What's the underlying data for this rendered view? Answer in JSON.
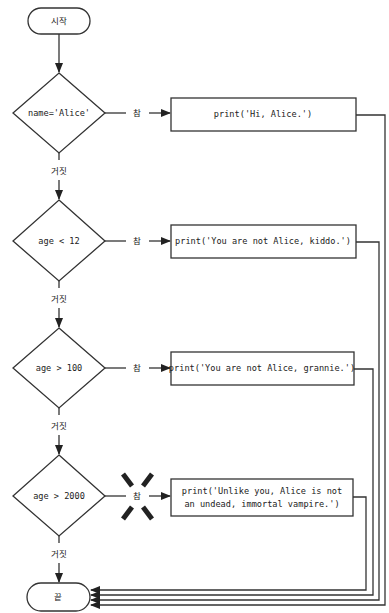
{
  "flowchart": {
    "start": {
      "label": "시작"
    },
    "end": {
      "label": "끝"
    },
    "decisions": [
      {
        "condition": "name='Alice'",
        "true_label": "참",
        "false_label": "거짓",
        "action": [
          "print('Hi, Alice.')"
        ]
      },
      {
        "condition": "age < 12",
        "true_label": "참",
        "false_label": "거짓",
        "action": [
          "print('You are not Alice, kiddo.')"
        ]
      },
      {
        "condition": "age > 100",
        "true_label": "참",
        "false_label": "거짓",
        "action": [
          "print('You are not Alice, grannie.')"
        ]
      },
      {
        "condition": "age > 2000",
        "true_label": "참",
        "false_label": "거짓",
        "action": [
          "print('Unlike you, Alice is not",
          "an undead, immortal vampire.')"
        ],
        "crossed_out": true
      }
    ]
  },
  "colors": {
    "stroke": "#333333",
    "text": "#222222",
    "background": "#ffffff"
  }
}
